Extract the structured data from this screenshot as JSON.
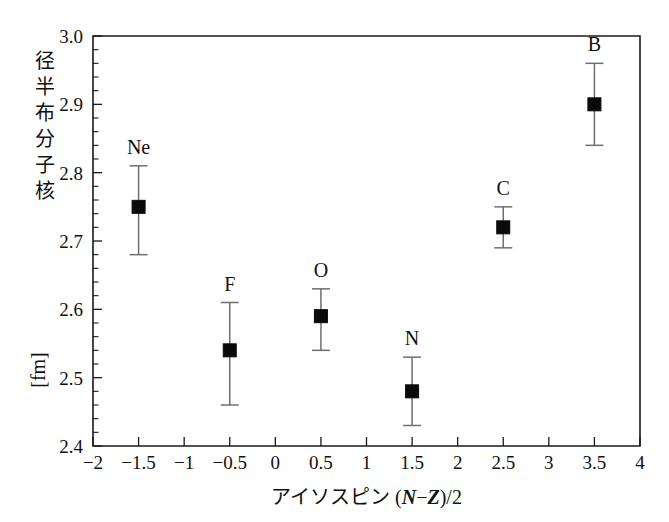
{
  "chart_data": {
    "type": "scatter",
    "title": "",
    "xlabel": "アイソスピン (N−Z)/2",
    "xlabel_parts": {
      "prefix": "アイソスピン",
      "paren_open": "(",
      "n_symbol": "N",
      "minus": "−",
      "z_symbol": "Z",
      "paren_close": ")",
      "suffix": "/2"
    },
    "ylabel": "核子分布半径 [fm]",
    "ylabel_chars": [
      "核",
      "子",
      "分",
      "布",
      "半",
      "径",
      "[fm]"
    ],
    "xlim": [
      -2,
      4
    ],
    "ylim": [
      2.4,
      3.0
    ],
    "x_tick_labels": [
      "−2",
      "−1.5",
      "−1",
      "−0.5",
      "0",
      "0.5",
      "1",
      "1.5",
      "2",
      "2.5",
      "3",
      "3.5",
      "4"
    ],
    "x_tick_values": [
      -2,
      -1.5,
      -1,
      -0.5,
      0,
      0.5,
      1,
      1.5,
      2,
      2.5,
      3,
      3.5,
      4
    ],
    "y_tick_labels": [
      "2.4",
      "2.5",
      "2.6",
      "2.7",
      "2.8",
      "2.9",
      "3.0"
    ],
    "y_tick_values": [
      2.4,
      2.5,
      2.6,
      2.7,
      2.8,
      2.9,
      3.0
    ],
    "y_minor_step": 0.02,
    "grid": false,
    "legend": "none",
    "point_labels_position": "above",
    "points": [
      {
        "label": "Ne",
        "x": -1.5,
        "y": 2.75,
        "yerr_low": 0.07,
        "yerr_high": 0.06
      },
      {
        "label": "F",
        "x": -0.5,
        "y": 2.54,
        "yerr_low": 0.08,
        "yerr_high": 0.07
      },
      {
        "label": "O",
        "x": 0.5,
        "y": 2.59,
        "yerr_low": 0.05,
        "yerr_high": 0.04
      },
      {
        "label": "N",
        "x": 1.5,
        "y": 2.48,
        "yerr_low": 0.05,
        "yerr_high": 0.05
      },
      {
        "label": "C",
        "x": 2.5,
        "y": 2.72,
        "yerr_low": 0.03,
        "yerr_high": 0.03
      },
      {
        "label": "B",
        "x": 3.5,
        "y": 2.9,
        "yerr_low": 0.06,
        "yerr_high": 0.06
      }
    ],
    "colors": {
      "marker": "#0a0a0a",
      "errorbar": "#6f6f6f",
      "axis": "#1a1a1a",
      "background": "#ffffff",
      "text": "#111111"
    }
  }
}
